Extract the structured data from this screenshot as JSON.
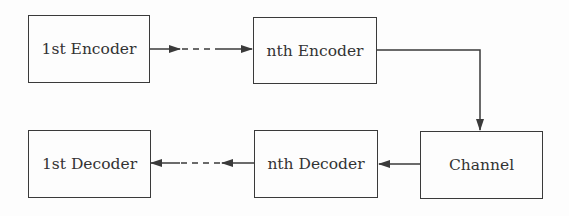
{
  "diagram": {
    "nodes": [
      {
        "id": "enc1",
        "label": "1st Encoder"
      },
      {
        "id": "encn",
        "label": "nth Encoder"
      },
      {
        "id": "channel",
        "label": "Channel"
      },
      {
        "id": "decn",
        "label": "nth Decoder"
      },
      {
        "id": "dec1",
        "label": "1st Decoder"
      }
    ],
    "edges": [
      {
        "from": "enc1",
        "to": "encn",
        "style": "dashed"
      },
      {
        "from": "encn",
        "to": "channel",
        "style": "solid"
      },
      {
        "from": "channel",
        "to": "decn",
        "style": "solid"
      },
      {
        "from": "decn",
        "to": "dec1",
        "style": "dashed"
      }
    ],
    "colors": {
      "stroke": "#3a3a3a",
      "background": "#fdfdfd",
      "text": "#333333"
    }
  }
}
